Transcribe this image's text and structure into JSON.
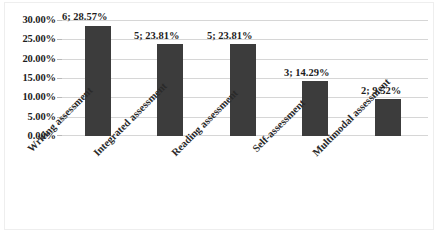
{
  "chart_data": {
    "type": "bar",
    "title": "",
    "subtitle": "",
    "xlabel": "",
    "ylabel": "",
    "categories": [
      "Writing assessment",
      "Integrated assessment",
      "Reading assessment",
      "Self-assessment",
      "Multimodal assessment"
    ],
    "values": [
      28.57,
      23.81,
      23.81,
      14.29,
      9.52
    ],
    "counts": [
      6,
      5,
      5,
      3,
      2
    ],
    "data_labels": [
      "6; 28.57%",
      "5; 23.81%",
      "5; 23.81%",
      "3; 14.29%",
      "2; 9.52%"
    ],
    "ylim": [
      0,
      30
    ],
    "ytick_values": [
      30,
      25,
      20,
      15,
      10,
      5,
      0
    ],
    "ytick_labels": [
      "30.00%",
      "25.00%",
      "20.00%",
      "15.00%",
      "10.00%",
      "5.00%",
      "0.00%"
    ],
    "grid": true,
    "grid_axis": "y",
    "legend": false,
    "legend_position": "none",
    "series": [
      {
        "name": "",
        "values": [
          28.57,
          23.81,
          23.81,
          14.29,
          9.52
        ]
      }
    ],
    "colors": {
      "bar": "#3c3c3c",
      "gridline": "#d6d6d6",
      "text": "#1d1d1d",
      "frame": "#eeeeee",
      "background": "#ffffff"
    },
    "label_rotation": -45
  }
}
